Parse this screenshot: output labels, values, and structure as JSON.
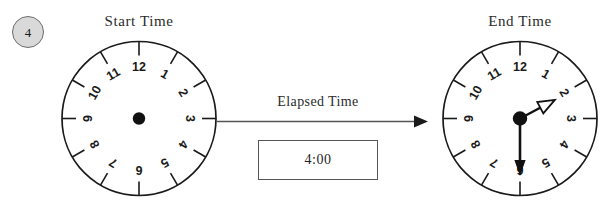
{
  "problem": {
    "number": "4",
    "badge_fill": "#d9d9d9",
    "badge_stroke": "#6e6e6e"
  },
  "colors": {
    "background": "#ffffff",
    "ink": "#1a1a1a",
    "label_ink": "#2b2b2b",
    "clock_rim": "#1a1a1a",
    "arrow_line": "#555555",
    "box_border": "#555555",
    "hand_fill": "#111111"
  },
  "start_clock": {
    "label": "Start Time",
    "numerals": [
      "12",
      "1",
      "2",
      "3",
      "4",
      "5",
      "6",
      "7",
      "8",
      "9",
      "10",
      "11"
    ],
    "has_hands": false,
    "center_dot": true,
    "hour_hand_value": "",
    "minute_hand_value": ""
  },
  "end_clock": {
    "label": "End Time",
    "numerals": [
      "12",
      "1",
      "2",
      "3",
      "4",
      "5",
      "6",
      "7",
      "8",
      "9",
      "10",
      "11"
    ],
    "has_hands": true,
    "center_dot": true,
    "hour_hand_value": "2",
    "minute_hand_value": "6",
    "hour_hand_style": "hollow-arrow",
    "minute_hand_style": "solid-arrow",
    "displayed_time": "1:30"
  },
  "elapsed": {
    "label": "Elapsed Time",
    "answer_value": "4:00",
    "arrow_direction": "right"
  }
}
